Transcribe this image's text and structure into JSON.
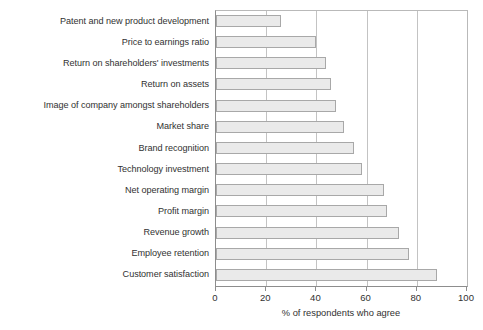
{
  "chart_data": {
    "type": "bar",
    "orientation": "horizontal",
    "title": "",
    "subtitle": "",
    "xlabel": "% of respondents who agree",
    "ylabel": "",
    "xlim": [
      0,
      100
    ],
    "ylim": null,
    "xticks": [
      0,
      20,
      40,
      60,
      80,
      100
    ],
    "xticklabels": [
      "0",
      "20",
      "40",
      "60",
      "80",
      "100"
    ],
    "grid": "vertical",
    "legend": null,
    "legend_position": "none",
    "annotations": [],
    "categories": [
      "Patent and new product development",
      "Price to earnings ratio",
      "Return on shareholders' investments",
      "Return on assets",
      "Image of company amongst shareholders",
      "Market share",
      "Brand recognition",
      "Technology investment",
      "Net operating margin",
      "Profit margin",
      "Revenue growth",
      "Employee retention",
      "Customer satisfaction"
    ],
    "values": [
      26,
      40,
      44,
      46,
      48,
      51,
      55,
      58,
      67,
      68,
      73,
      77,
      88
    ],
    "bar_fill_color": "#eaeaea",
    "bar_border_color": "#a8a8a8",
    "axis_color": "#8d8d8d",
    "grid_color": "#c3c3c3",
    "text_color": "#313131"
  }
}
